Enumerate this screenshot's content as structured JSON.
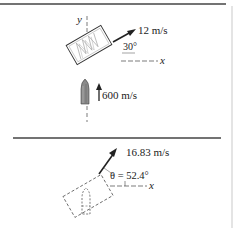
{
  "upper_panel": {
    "y_axis_label": "y",
    "x_axis_label": "x",
    "block_velocity_label": "12 m/s",
    "block_angle_label": "30°",
    "bullet_velocity_label": "600 m/s"
  },
  "lower_panel": {
    "x_axis_label": "x",
    "combined_velocity_label": "16.83 m/s",
    "angle_label": "θ = 52.4°"
  },
  "colors": {
    "ink": "#222222",
    "rule": "#444444",
    "hatch": "#9a9a9a",
    "bullet_fill": "#8a8a8a"
  }
}
